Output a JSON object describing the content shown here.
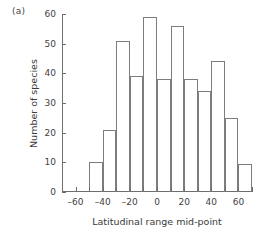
{
  "panel": {
    "label": "(a)"
  },
  "chart_data": {
    "type": "bar",
    "title": "",
    "subtitle": "",
    "xlabel": "Latitudinal range mid-point",
    "ylabel": "Number of species",
    "xlim": [
      -70,
      70
    ],
    "ylim": [
      0,
      60
    ],
    "bin_width": 10,
    "grid": false,
    "legend": null,
    "annotations": [],
    "xticks": [
      -60,
      -40,
      -20,
      0,
      20,
      40,
      60
    ],
    "xticklabels": [
      "–60",
      "–40",
      "–20",
      "0",
      "20",
      "40",
      "60"
    ],
    "xminorticks": [
      -70,
      -50,
      -30,
      -10,
      10,
      30,
      50,
      70
    ],
    "yticks": [
      0,
      10,
      20,
      30,
      40,
      50,
      60
    ],
    "yticklabels": [
      "0",
      "10",
      "20",
      "30",
      "40",
      "50",
      "60"
    ],
    "bin_edges": [
      -50,
      -40,
      -30,
      -20,
      -10,
      0,
      10,
      20,
      30,
      40,
      50,
      60,
      70
    ],
    "categories": [
      "-50..-40",
      "-40..-30",
      "-30..-20",
      "-20..-10",
      "-10..0",
      "0..10",
      "10..20",
      "20..30",
      "30..40",
      "40..50",
      "50..60",
      "60..70"
    ],
    "values": [
      10,
      21,
      51,
      39,
      59,
      38,
      56,
      38,
      34,
      44,
      25,
      9.5
    ]
  }
}
